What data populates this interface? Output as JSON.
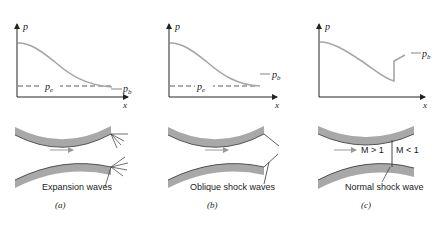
{
  "panels": [
    {
      "id": "a",
      "caption": "(a)",
      "axis_y_label": "p",
      "axis_x_label": "x",
      "pe_label": "p",
      "pe_sub": "e",
      "pb_label": "p",
      "pb_sub": "b",
      "wave_label": "Expansion waves"
    },
    {
      "id": "b",
      "caption": "(b)",
      "axis_y_label": "p",
      "axis_x_label": "x",
      "pe_label": "p",
      "pe_sub": "e",
      "pb_label": "p",
      "pb_sub": "b",
      "wave_label": "Oblique shock waves"
    },
    {
      "id": "c",
      "caption": "(c)",
      "axis_y_label": "p",
      "axis_x_label": "x",
      "pb_label": "p",
      "pb_sub": "b",
      "wave_label": "Normal shock wave",
      "mach_upstream": "M > 1",
      "mach_downstream": "M < 1"
    }
  ],
  "colors": {
    "curve": "#a6a6a6",
    "wall": "#a8a8a8",
    "wall_edge": "#333333",
    "axis": "#222222",
    "text": "#222222"
  }
}
